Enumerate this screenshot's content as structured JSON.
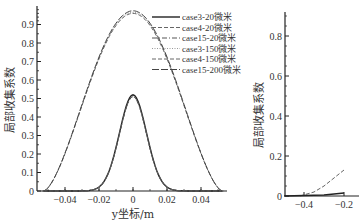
{
  "chart_data": [
    {
      "type": "line",
      "title": "",
      "xlabel": "y坐标/m",
      "ylabel": "局部收集系数",
      "xlim": [
        -0.053,
        0.053
      ],
      "ylim": [
        0,
        1.0
      ],
      "xticks": [
        "-0.04",
        "-0.02",
        "0",
        "0.02",
        "0.04"
      ],
      "yticks": [
        "0",
        "0.1",
        "0.2",
        "0.3",
        "0.4",
        "0.5",
        "0.6",
        "0.7",
        "0.8",
        "0.9"
      ],
      "grid": false,
      "legend_position": "upper right",
      "legend": [
        "case3-20微米",
        "case4-20微米",
        "case15-20微米",
        "case3-150微米",
        "case4-150微米",
        "case15-200微米"
      ],
      "x": [
        -0.05,
        -0.04,
        -0.03,
        -0.02,
        -0.01,
        0,
        0.01,
        0.02,
        0.03,
        0.04,
        0.05
      ],
      "series": [
        {
          "name": "case3-20微米",
          "style": "solid",
          "values": [
            0,
            0,
            0.005,
            0.1,
            0.35,
            0.52,
            0.35,
            0.08,
            0.005,
            0,
            0
          ]
        },
        {
          "name": "case4-20微米",
          "style": "dashed",
          "values": [
            0,
            0,
            0.005,
            0.1,
            0.35,
            0.51,
            0.35,
            0.08,
            0.005,
            0,
            0
          ]
        },
        {
          "name": "case15-20微米",
          "style": "dashdot",
          "values": [
            0,
            0,
            0.005,
            0.1,
            0.34,
            0.51,
            0.34,
            0.08,
            0.005,
            0,
            0
          ]
        },
        {
          "name": "case3-150微米",
          "style": "dotted",
          "values": [
            0.02,
            0.17,
            0.4,
            0.65,
            0.88,
            0.97,
            0.88,
            0.65,
            0.4,
            0.17,
            0.02
          ]
        },
        {
          "name": "case4-150微米",
          "style": "dashed",
          "values": [
            0.02,
            0.16,
            0.39,
            0.64,
            0.87,
            0.96,
            0.87,
            0.64,
            0.39,
            0.16,
            0.02
          ]
        },
        {
          "name": "case15-200微米",
          "style": "longdash",
          "values": [
            0.03,
            0.18,
            0.41,
            0.66,
            0.89,
            0.97,
            0.89,
            0.66,
            0.41,
            0.18,
            0.03
          ]
        }
      ]
    },
    {
      "type": "line",
      "title": "",
      "xlabel": "",
      "ylabel": "局部收集系数",
      "xlim": [
        -0.5,
        0.0
      ],
      "ylim": [
        0,
        0.95
      ],
      "xticks": [
        "-0.4",
        "-0.2"
      ],
      "yticks": [
        "0",
        "0.2",
        "0.4",
        "0.6",
        "0.8"
      ],
      "grid": false,
      "series": [
        {
          "name": "dashed",
          "style": "dashed",
          "x": [
            -0.42,
            -0.35,
            -0.3,
            -0.25,
            -0.2
          ],
          "values": [
            0,
            0.02,
            0.05,
            0.09,
            0.13
          ]
        },
        {
          "name": "solid",
          "style": "solid",
          "x": [
            -0.5,
            -0.3,
            -0.2
          ],
          "values": [
            0,
            0.005,
            0.015
          ]
        }
      ]
    }
  ],
  "labels": {
    "left_ylabel": "局部收集系数",
    "left_xlabel": "y坐标/m",
    "right_ylabel": "局部收集系数"
  }
}
